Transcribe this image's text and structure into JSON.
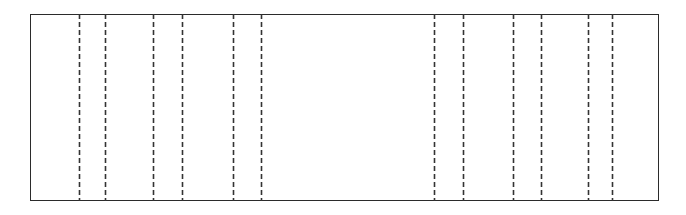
{
  "figure": {
    "title": "",
    "background_color": "#ffffff",
    "width": 686,
    "height": 215
  },
  "chart_data": {
    "type": "diagram",
    "title": "",
    "xlabel": "",
    "ylabel": "",
    "grid": false,
    "legend": null,
    "frame": {
      "name": "outer-rectangle",
      "x": 30,
      "y": 14,
      "width": 629,
      "height": 187,
      "stroke_color": "#2b2b2b",
      "stroke_width": 1.4,
      "fill": "none",
      "style": "solid"
    },
    "vertical_lines": {
      "style": "dashed",
      "stroke_color": "#333333",
      "stroke_width": 1.6,
      "dash_length": 5,
      "dash_gap": 3,
      "y_top": 14,
      "y_bottom": 201,
      "count": 12,
      "x_positions": [
        79,
        105,
        153,
        182,
        233,
        261,
        434,
        463,
        513,
        541,
        588,
        612
      ]
    },
    "segments": [
      {
        "index": 1,
        "start": 30,
        "end": 79,
        "width": 49
      },
      {
        "index": 2,
        "start": 79,
        "end": 105,
        "width": 26
      },
      {
        "index": 3,
        "start": 105,
        "end": 153,
        "width": 48
      },
      {
        "index": 4,
        "start": 153,
        "end": 182,
        "width": 29
      },
      {
        "index": 5,
        "start": 182,
        "end": 233,
        "width": 51
      },
      {
        "index": 6,
        "start": 233,
        "end": 261,
        "width": 28
      },
      {
        "index": 7,
        "start": 261,
        "end": 434,
        "width": 173
      },
      {
        "index": 8,
        "start": 434,
        "end": 463,
        "width": 29
      },
      {
        "index": 9,
        "start": 463,
        "end": 513,
        "width": 50
      },
      {
        "index": 10,
        "start": 513,
        "end": 541,
        "width": 28
      },
      {
        "index": 11,
        "start": 541,
        "end": 588,
        "width": 47
      },
      {
        "index": 12,
        "start": 588,
        "end": 612,
        "width": 24
      },
      {
        "index": 13,
        "start": 612,
        "end": 659,
        "width": 47
      }
    ],
    "xlim": [
      30,
      659
    ],
    "ylim": [
      14,
      201
    ]
  }
}
